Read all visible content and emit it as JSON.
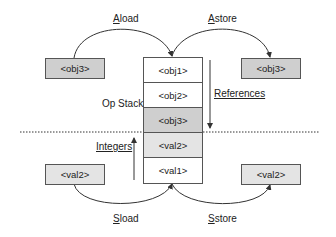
{
  "diagram": {
    "operations": {
      "aload": "Aload",
      "astore": "Astore",
      "sload": "Sload",
      "sstore": "Sstore"
    },
    "labels": {
      "op_stack": "Op Stack",
      "references": "References",
      "integers": "Integers"
    },
    "stack": [
      {
        "label": "<obj1>",
        "fill": "#ffffff"
      },
      {
        "label": "<obj2>",
        "fill": "#ffffff"
      },
      {
        "label": "<obj3>",
        "fill": "#cfcfcf"
      },
      {
        "label": "<val2>",
        "fill": "#e4e4e4"
      },
      {
        "label": "<val1>",
        "fill": "#ffffff"
      }
    ],
    "side_boxes": {
      "left_ref": "<obj3>",
      "right_ref": "<obj3>",
      "left_int": "<val2>",
      "right_int": "<val2>"
    },
    "colors": {
      "ref_box": "#cfcfcf",
      "int_box": "#e4e4e4",
      "line": "#333333"
    }
  }
}
